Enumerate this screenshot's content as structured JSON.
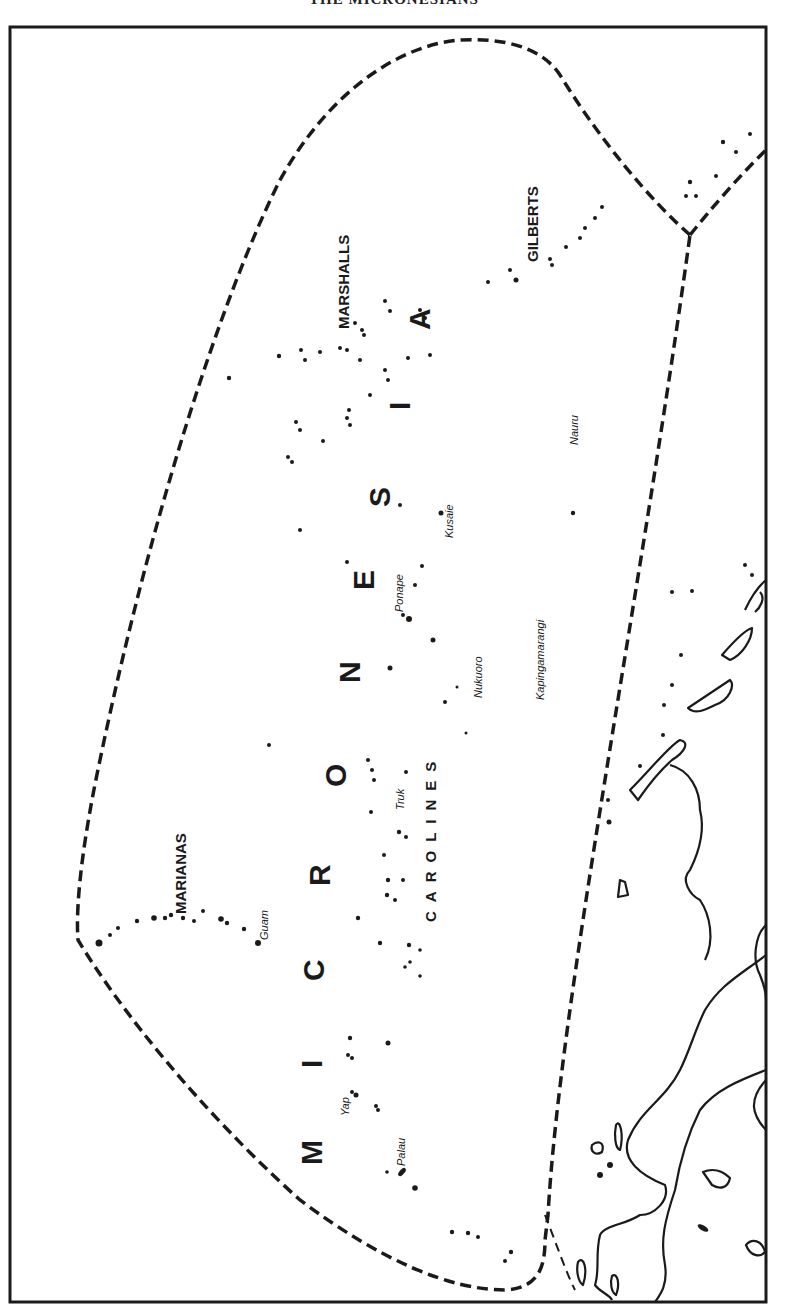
{
  "page_title": "THE MICRONESIANS",
  "map": {
    "region_label": "MICRONESIA",
    "region_letters": [
      "M",
      "I",
      "C",
      "R",
      "O",
      "N",
      "E",
      "S",
      "I",
      "A"
    ],
    "island_groups": {
      "marianas": "MARIANAS",
      "marshalls": "MARSHALLS",
      "gilberts": "GILBERTS",
      "carolines": "CAROLINES"
    },
    "islands": {
      "guam": "Guam",
      "yap": "Yap",
      "palau": "Palau",
      "truk": "Truk",
      "ponape": "Ponape",
      "kusaie": "Kusaie",
      "nukuoro": "Nukuoro",
      "kapingamarangi": "Kapingamarangi",
      "nauru": "Nauru"
    },
    "orientation": "rotated 90° counter-clockwise",
    "colors": {
      "ink": "#1a1a1a",
      "paper": "#ffffff"
    }
  }
}
